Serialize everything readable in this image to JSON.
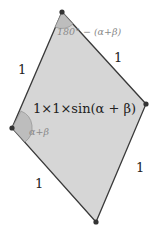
{
  "diagram": {
    "vertices": {
      "top": [
        62,
        12
      ],
      "right": [
        146,
        104
      ],
      "bottom": [
        96,
        222
      ],
      "left": [
        12,
        128
      ]
    },
    "side_labels": {
      "top_left": "1",
      "top_right": "1",
      "bottom_left": "1",
      "bottom_right": "1"
    },
    "top_angle_label": "180° − (α+β)",
    "left_angle_label": "α+β",
    "area_label": "1×1×sin(α + β)",
    "colors": {
      "fill": "#d6d6d6",
      "stroke": "#3a3a3a",
      "angle_fill": "#bdbdbd",
      "angle_text": "#8a8a8a",
      "text": "#222222"
    }
  }
}
